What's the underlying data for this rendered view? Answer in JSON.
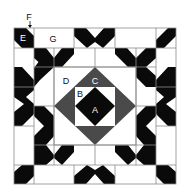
{
  "diagram": {
    "colors": {
      "background": "#ffffff",
      "grid_line": "#8a8a8a",
      "dark": "#0a0a0a",
      "medium": "#4a4a4a",
      "label_light": "#ffffff",
      "label_dark": "#111111"
    },
    "labels": {
      "A": "A",
      "B": "B",
      "C": "C",
      "D": "D",
      "E": "E",
      "F": "F",
      "G": "G"
    },
    "pointer": {
      "label": "F",
      "description": "arrow pointing to seam between E and G"
    }
  }
}
